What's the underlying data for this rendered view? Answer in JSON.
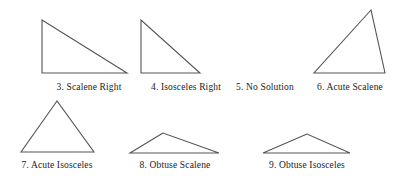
{
  "page": {
    "background_color": "#ffffff",
    "stroke_color": "#555555",
    "text_color": "#1a1a1a",
    "width": 398,
    "height": 183
  },
  "figures": [
    {
      "number": "3",
      "label": "3. Scalene Right",
      "classification": "Scalene Right",
      "has_shape": true,
      "shape": "triangle",
      "points": "42,20 42,73 127,73",
      "label_x": 89,
      "label_y": 82
    },
    {
      "number": "4",
      "label": "4. Isosceles Right",
      "classification": "Isosceles Right",
      "has_shape": true,
      "shape": "triangle",
      "points": "141,20 141,73 200,73",
      "label_x": 186,
      "label_y": 82
    },
    {
      "number": "5",
      "label": "5. No Solution",
      "classification": "No Solution",
      "has_shape": false,
      "shape": "none",
      "points": "",
      "label_x": 265,
      "label_y": 82
    },
    {
      "number": "6",
      "label": "6. Acute Scalene",
      "classification": "Acute Scalene",
      "has_shape": true,
      "shape": "triangle",
      "points": "371,10 314,73 385,73",
      "label_x": 350,
      "label_y": 82
    },
    {
      "number": "7",
      "label": "7. Acute Isosceles",
      "classification": "Acute Isosceles",
      "has_shape": true,
      "shape": "triangle",
      "points": "57,101 21,152 94,152",
      "label_x": 57,
      "label_y": 160
    },
    {
      "number": "8",
      "label": "8. Obtuse Scalene",
      "classification": "Obtuse Scalene",
      "has_shape": true,
      "shape": "triangle",
      "points": "163,133 130,153 219,153",
      "label_x": 175,
      "label_y": 160
    },
    {
      "number": "9",
      "label": "9. Obtuse Isosceles",
      "classification": "Obtuse Isosceles",
      "has_shape": true,
      "shape": "triangle",
      "points": "307,134 263,153 350,153",
      "label_x": 307,
      "label_y": 160
    }
  ]
}
